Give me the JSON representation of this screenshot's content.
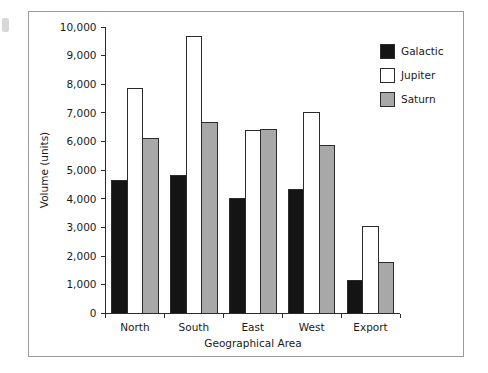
{
  "chart_data": {
    "type": "bar",
    "title": "",
    "subtitle": "",
    "xlabel": "Geographical Area",
    "ylabel": "Volume (units)",
    "categories": [
      "North",
      "South",
      "East",
      "West",
      "Export"
    ],
    "series": [
      {
        "name": "Galactic",
        "color": "#141414",
        "values": [
          4650,
          4820,
          4030,
          4330,
          1150
        ]
      },
      {
        "name": "Jupiter",
        "color": "#ffffff",
        "values": [
          7850,
          9680,
          6400,
          7000,
          3020
        ]
      },
      {
        "name": "Saturn",
        "color": "#a8a8a8",
        "values": [
          6100,
          6650,
          6430,
          5870,
          1780
        ]
      }
    ],
    "ylim": [
      0,
      10000
    ],
    "ytick_step": 1000,
    "ytick_labels": [
      "0",
      "1,000",
      "2,000",
      "3,000",
      "4,000",
      "5,000",
      "6,000",
      "7,000",
      "8,000",
      "9,000",
      "10,000"
    ],
    "ytick_values": [
      0,
      1000,
      2000,
      3000,
      4000,
      5000,
      6000,
      7000,
      8000,
      9000,
      10000
    ],
    "grid": false,
    "legend_position": "top-right",
    "bar_edge_color": "#2b2b2b",
    "frame_color": "#9a9a9a",
    "background": "#ffffff"
  },
  "legend": {
    "entries": [
      {
        "label": "Galactic"
      },
      {
        "label": "Jupiter"
      },
      {
        "label": "Saturn"
      }
    ]
  }
}
